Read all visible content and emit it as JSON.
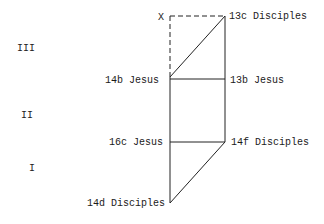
{
  "diagram": {
    "section_labels": [
      {
        "id": "III",
        "text": "III",
        "x": 17,
        "y": 44
      },
      {
        "id": "II",
        "text": "II",
        "x": 21,
        "y": 111
      },
      {
        "id": "I",
        "text": "I",
        "x": 29,
        "y": 164
      }
    ],
    "marker": {
      "text": "X",
      "x": 158,
      "y": 15
    },
    "node_labels": [
      {
        "id": "13c",
        "text": "13c Disciples",
        "x": 229,
        "y": 13
      },
      {
        "id": "14b",
        "text": "14b Jesus",
        "x": 105,
        "y": 76
      },
      {
        "id": "13b",
        "text": "13b Jesus",
        "x": 230,
        "y": 76
      },
      {
        "id": "16c",
        "text": "16c Jesus",
        "x": 109,
        "y": 138
      },
      {
        "id": "14f",
        "text": "14f Disciples",
        "x": 231,
        "y": 138
      },
      {
        "id": "14d",
        "text": "14d Disciples",
        "x": 87,
        "y": 199
      }
    ],
    "lines": {
      "color": "#222222",
      "left_x": 170,
      "right_x": 225,
      "top_y": 16,
      "mid_upper_y": 79,
      "mid_lower_y": 142,
      "bottom_y": 203
    }
  }
}
